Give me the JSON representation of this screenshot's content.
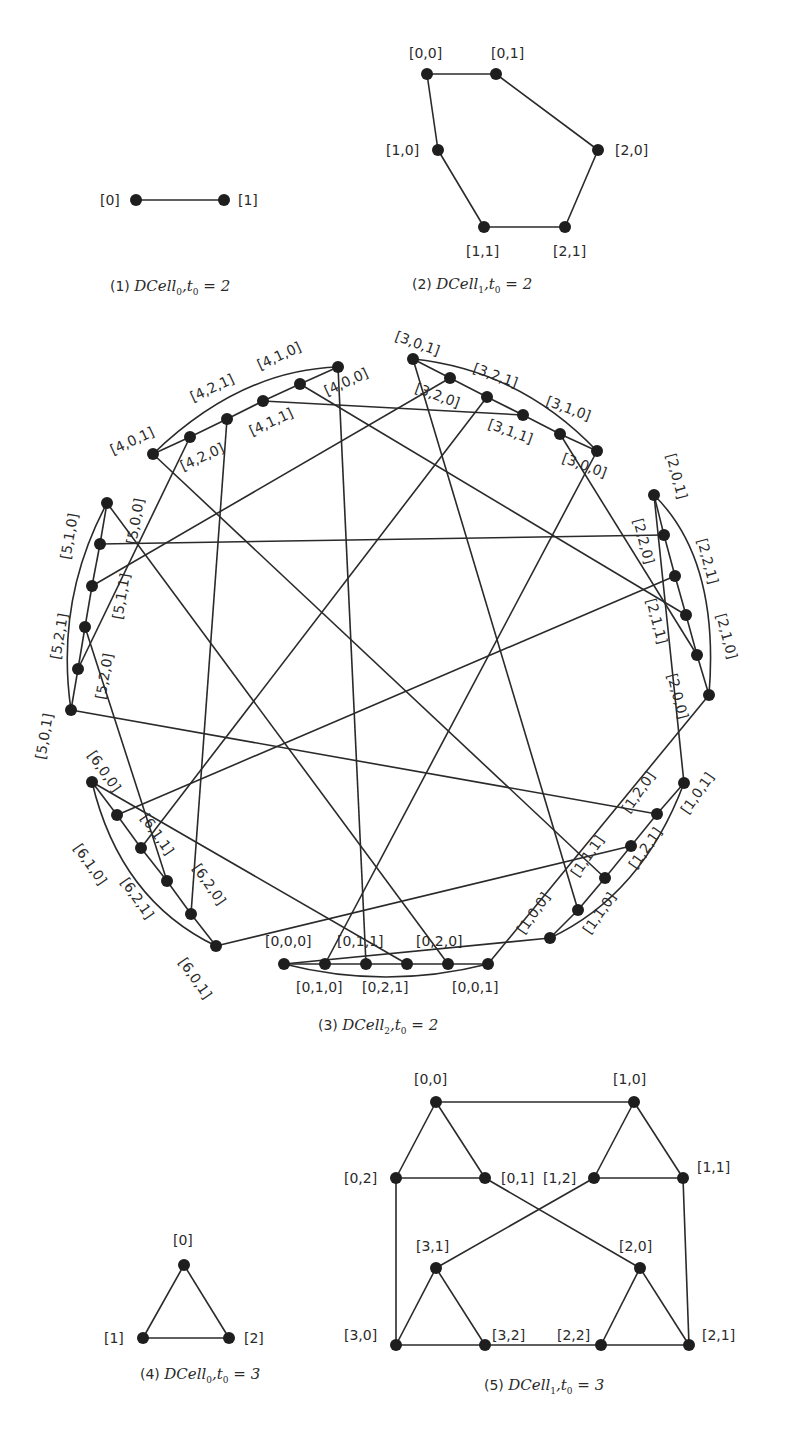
{
  "figure": {
    "panels": [
      {
        "id": "p1",
        "caption": {
          "num": "(1)",
          "name": "DCell",
          "sub": "0",
          "rest": ",t",
          "rest_sub": "0",
          "eq": "= 2",
          "x": 110,
          "y": 291
        },
        "nodes": [
          {
            "id": "a0",
            "label": "[0]",
            "x": 136,
            "y": 200,
            "lx": 100,
            "ly": 205
          },
          {
            "id": "a1",
            "label": "[1]",
            "x": 224,
            "y": 200,
            "lx": 238,
            "ly": 205
          }
        ],
        "edges": [
          [
            "a0",
            "a1"
          ]
        ]
      },
      {
        "id": "p2",
        "caption": {
          "num": "(2)",
          "name": "DCell",
          "sub": "1",
          "rest": ",t",
          "rest_sub": "0",
          "eq": "= 2",
          "x": 412,
          "y": 289
        },
        "nodes": [
          {
            "id": "b00",
            "label": "[0,0]",
            "x": 427,
            "y": 74,
            "lx": 409,
            "ly": 58
          },
          {
            "id": "b01",
            "label": "[0,1]",
            "x": 496,
            "y": 74,
            "lx": 491,
            "ly": 58
          },
          {
            "id": "b20",
            "label": "[2,0]",
            "x": 598,
            "y": 150,
            "lx": 615,
            "ly": 155
          },
          {
            "id": "b21",
            "label": "[2,1]",
            "x": 565,
            "y": 227,
            "lx": 553,
            "ly": 256
          },
          {
            "id": "b11",
            "label": "[1,1]",
            "x": 484,
            "y": 227,
            "lx": 466,
            "ly": 256
          },
          {
            "id": "b10",
            "label": "[1,0]",
            "x": 438,
            "y": 150,
            "lx": 386,
            "ly": 155
          }
        ],
        "edges": [
          [
            "b00",
            "b01"
          ],
          [
            "b01",
            "b20"
          ],
          [
            "b20",
            "b21"
          ],
          [
            "b21",
            "b11"
          ],
          [
            "b11",
            "b10"
          ],
          [
            "b10",
            "b00"
          ]
        ]
      },
      {
        "id": "p4",
        "caption": {
          "num": "(4)",
          "name": "DCell",
          "sub": "0",
          "rest": ",t",
          "rest_sub": "0",
          "eq": "= 3",
          "x": 140,
          "y": 1379
        },
        "nodes": [
          {
            "id": "d0",
            "label": "[0]",
            "x": 184,
            "y": 1265,
            "lx": 173,
            "ly": 1245
          },
          {
            "id": "d1",
            "label": "[1]",
            "x": 143,
            "y": 1338,
            "lx": 104,
            "ly": 1343
          },
          {
            "id": "d2",
            "label": "[2]",
            "x": 229,
            "y": 1338,
            "lx": 244,
            "ly": 1343
          }
        ],
        "edges": [
          [
            "d0",
            "d1"
          ],
          [
            "d1",
            "d2"
          ],
          [
            "d2",
            "d0"
          ]
        ]
      },
      {
        "id": "p5",
        "caption": {
          "num": "(5)",
          "name": "DCell",
          "sub": "1",
          "rest": ",t",
          "rest_sub": "0",
          "eq": "= 3",
          "x": 484,
          "y": 1390
        },
        "nodes": [
          {
            "id": "e00",
            "label": "[0,0]",
            "x": 436,
            "y": 1102,
            "lx": 414,
            "ly": 1084
          },
          {
            "id": "e01",
            "label": "[0,1]",
            "x": 485,
            "y": 1178,
            "lx": 501,
            "ly": 1183
          },
          {
            "id": "e02",
            "label": "[0,2]",
            "x": 396,
            "y": 1178,
            "lx": 344,
            "ly": 1183
          },
          {
            "id": "e10",
            "label": "[1,0]",
            "x": 634,
            "y": 1102,
            "lx": 613,
            "ly": 1084
          },
          {
            "id": "e11",
            "label": "[1,1]",
            "x": 683,
            "y": 1178,
            "lx": 697,
            "ly": 1172
          },
          {
            "id": "e12",
            "label": "[1,2]",
            "x": 594,
            "y": 1178,
            "lx": 543,
            "ly": 1183
          },
          {
            "id": "e20",
            "label": "[2,0]",
            "x": 640,
            "y": 1268,
            "lx": 619,
            "ly": 1251
          },
          {
            "id": "e21",
            "label": "[2,1]",
            "x": 689,
            "y": 1345,
            "lx": 702,
            "ly": 1340
          },
          {
            "id": "e22",
            "label": "[2,2]",
            "x": 601,
            "y": 1345,
            "lx": 557,
            "ly": 1340
          },
          {
            "id": "e30",
            "label": "[3,0]",
            "x": 396,
            "y": 1345,
            "lx": 344,
            "ly": 1340
          },
          {
            "id": "e31",
            "label": "[3,1]",
            "x": 436,
            "y": 1268,
            "lx": 416,
            "ly": 1251
          },
          {
            "id": "e32",
            "label": "[3,2]",
            "x": 485,
            "y": 1345,
            "lx": 492,
            "ly": 1340
          }
        ],
        "edges": [
          [
            "e00",
            "e10"
          ],
          [
            "e00",
            "e02"
          ],
          [
            "e00",
            "e01"
          ],
          [
            "e02",
            "e01"
          ],
          [
            "e10",
            "e12"
          ],
          [
            "e10",
            "e11"
          ],
          [
            "e12",
            "e11"
          ],
          [
            "e02",
            "e30"
          ],
          [
            "e11",
            "e21"
          ],
          [
            "e01",
            "e20"
          ],
          [
            "e12",
            "e31"
          ],
          [
            "e31",
            "e30"
          ],
          [
            "e31",
            "e32"
          ],
          [
            "e30",
            "e32"
          ],
          [
            "e20",
            "e22"
          ],
          [
            "e20",
            "e21"
          ],
          [
            "e22",
            "e21"
          ],
          [
            "e32",
            "e22"
          ]
        ]
      }
    ],
    "ring": {
      "id": "p3",
      "caption": {
        "num": "(3)",
        "name": "DCell",
        "sub": "2",
        "rest": ",t",
        "rest_sub": "0",
        "eq": "= 2",
        "x": 318,
        "y": 1030
      },
      "chain_labels_order": [
        "[c,0,1]",
        "[c,2,0]",
        "[c,2,1]",
        "[c,1,1]",
        "[c,1,0]",
        "[c,0,0]"
      ],
      "chain_uid_order": [
        1,
        4,
        5,
        3,
        2,
        0
      ],
      "clusters": [
        {
          "cell": 0,
          "points": [
            [
              488,
              964
            ],
            [
              448,
              964
            ],
            [
              407,
              964
            ],
            [
              366,
              964
            ],
            [
              325,
              964
            ],
            [
              284,
              964
            ]
          ],
          "labels": [
            {
              "t": "[0,0,1]",
              "x": 452,
              "y": 992,
              "r": 0
            },
            {
              "t": "[0,2,0]",
              "x": 416,
              "y": 946,
              "r": 0
            },
            {
              "t": "[0,2,1]",
              "x": 362,
              "y": 992,
              "r": 0
            },
            {
              "t": "[0,1,1]",
              "x": 337,
              "y": 946,
              "r": 0
            },
            {
              "t": "[0,1,0]",
              "x": 296,
              "y": 992,
              "r": 0
            },
            {
              "t": "[0,0,0]",
              "x": 265,
              "y": 946,
              "r": 0
            }
          ],
          "arc": "M284,964 Q386,990 488,964"
        },
        {
          "cell": 1,
          "points": [
            [
              684,
              783
            ],
            [
              657,
              814
            ],
            [
              631,
              846
            ],
            [
              605,
              878
            ],
            [
              578,
              910
            ],
            [
              550,
              938
            ]
          ],
          "labels": [
            {
              "t": "[1,0,1]",
              "x": 688,
              "y": 815,
              "r": -55
            },
            {
              "t": "[1,2,0]",
              "x": 629,
              "y": 814,
              "r": -55
            },
            {
              "t": "[1,2,1]",
              "x": 636,
              "y": 870,
              "r": -55
            },
            {
              "t": "[1,1,1]",
              "x": 578,
              "y": 878,
              "r": -55
            },
            {
              "t": "[1,1,0]",
              "x": 590,
              "y": 935,
              "r": -55
            },
            {
              "t": "[1,0,0]",
              "x": 524,
              "y": 935,
              "r": -55
            }
          ],
          "arc": "M684,783 Q642,895 550,938"
        },
        {
          "cell": 2,
          "points": [
            [
              654,
              495
            ],
            [
              664,
              535
            ],
            [
              675,
              576
            ],
            [
              686,
              615
            ],
            [
              697,
              655
            ],
            [
              709,
              695
            ]
          ],
          "labels": [
            {
              "t": "[2,0,1]",
              "x": 666,
              "y": 455,
              "r": 75
            },
            {
              "t": "[2,2,0]",
              "x": 633,
              "y": 520,
              "r": 75
            },
            {
              "t": "[2,2,1]",
              "x": 697,
              "y": 540,
              "r": 75
            },
            {
              "t": "[2,1,1]",
              "x": 646,
              "y": 600,
              "r": 75
            },
            {
              "t": "[2,1,0]",
              "x": 716,
              "y": 615,
              "r": 75
            },
            {
              "t": "[2,0,0]",
              "x": 667,
              "y": 675,
              "r": 75
            }
          ],
          "arc": "M654,495 Q720,560 709,695"
        },
        {
          "cell": 3,
          "points": [
            [
              413,
              359
            ],
            [
              450,
              378
            ],
            [
              487,
              397
            ],
            [
              523,
              415
            ],
            [
              560,
              434
            ],
            [
              597,
              451
            ]
          ],
          "labels": [
            {
              "t": "[3,0,1]",
              "x": 394,
              "y": 340,
              "r": 20
            },
            {
              "t": "[3,2,0]",
              "x": 414,
              "y": 392,
              "r": 20
            },
            {
              "t": "[3,2,1]",
              "x": 472,
              "y": 372,
              "r": 20
            },
            {
              "t": "[3,1,1]",
              "x": 487,
              "y": 428,
              "r": 20
            },
            {
              "t": "[3,1,0]",
              "x": 545,
              "y": 405,
              "r": 20
            },
            {
              "t": "[3,0,0]",
              "x": 561,
              "y": 462,
              "r": 20
            }
          ],
          "arc": "M413,359 Q520,370 597,451"
        },
        {
          "cell": 4,
          "points": [
            [
              153,
              454
            ],
            [
              190,
              437
            ],
            [
              227,
              419
            ],
            [
              263,
              401
            ],
            [
              300,
              384
            ],
            [
              338,
              367
            ]
          ],
          "labels": [
            {
              "t": "[4,0,1]",
              "x": 113,
              "y": 455,
              "r": -25
            },
            {
              "t": "[4,2,0]",
              "x": 183,
              "y": 471,
              "r": -25
            },
            {
              "t": "[4,2,1]",
              "x": 193,
              "y": 402,
              "r": -25
            },
            {
              "t": "[4,1,1]",
              "x": 252,
              "y": 436,
              "r": -25
            },
            {
              "t": "[4,1,0]",
              "x": 260,
              "y": 370,
              "r": -25
            },
            {
              "t": "[4,0,0]",
              "x": 327,
              "y": 396,
              "r": -25
            }
          ],
          "arc": "M153,454 Q240,370 338,367"
        },
        {
          "cell": 5,
          "points": [
            [
              71,
              710
            ],
            [
              78,
              669
            ],
            [
              85,
              627
            ],
            [
              92,
              586
            ],
            [
              100,
              544
            ],
            [
              107,
              503
            ]
          ],
          "labels": [
            {
              "t": "[5,0,1]",
              "x": 45,
              "y": 760,
              "r": -80
            },
            {
              "t": "[5,2,0]",
              "x": 105,
              "y": 700,
              "r": -80
            },
            {
              "t": "[5,2,1]",
              "x": 60,
              "y": 660,
              "r": -80
            },
            {
              "t": "[5,1,1]",
              "x": 122,
              "y": 620,
              "r": -80
            },
            {
              "t": "[5,1,0]",
              "x": 70,
              "y": 560,
              "r": -80
            },
            {
              "t": "[5,0,0]",
              "x": 136,
              "y": 545,
              "r": -80
            }
          ],
          "arc": "M71,710 Q55,600 107,503"
        },
        {
          "cell": 6,
          "points": [
            [
              216,
              946
            ],
            [
              191,
              914
            ],
            [
              167,
              881
            ],
            [
              141,
              848
            ],
            [
              117,
              815
            ],
            [
              92,
              782
            ]
          ],
          "labels": [
            {
              "t": "[6,0,1]",
              "x": 178,
              "y": 962,
              "r": 55
            },
            {
              "t": "[6,2,0]",
              "x": 192,
              "y": 868,
              "r": 55
            },
            {
              "t": "[6,2,1]",
              "x": 120,
              "y": 882,
              "r": 55
            },
            {
              "t": "[6,1,1]",
              "x": 140,
              "y": 818,
              "r": 55
            },
            {
              "t": "[6,1,0]",
              "x": 73,
              "y": 848,
              "r": 55
            },
            {
              "t": "[6,0,0]",
              "x": 87,
              "y": 755,
              "r": 55
            }
          ],
          "arc": "M216,946 Q120,900 92,782"
        }
      ]
    }
  }
}
